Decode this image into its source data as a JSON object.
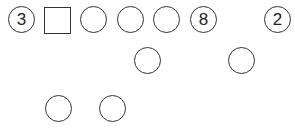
{
  "puzzle": {
    "row1": [
      {
        "shape": "circle",
        "value": "3"
      },
      {
        "shape": "square",
        "value": ""
      },
      {
        "shape": "circle",
        "value": ""
      },
      {
        "shape": "circle",
        "value": ""
      },
      {
        "shape": "circle",
        "value": ""
      },
      {
        "shape": "circle",
        "value": "8"
      },
      {
        "shape": "circle",
        "value": "2"
      }
    ],
    "row2": [
      {
        "shape": "circle",
        "value": ""
      },
      {
        "shape": "circle",
        "value": ""
      }
    ],
    "row3": [
      {
        "shape": "circle",
        "value": ""
      },
      {
        "shape": "circle",
        "value": ""
      }
    ]
  }
}
